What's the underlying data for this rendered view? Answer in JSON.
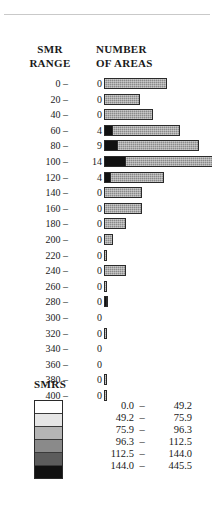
{
  "figure": {
    "header": {
      "left_line1": "SMR",
      "left_line2": "RANGE",
      "right_line1": "NUMBER",
      "right_line2": "OF AREAS"
    },
    "legend": {
      "title": "SMRS",
      "dash": "–",
      "entries": [
        {
          "low": "0.0",
          "high": "49.2",
          "color": "#ffffff"
        },
        {
          "low": "49.2",
          "high": "75.9",
          "color": "#e6e6e6"
        },
        {
          "low": "75.9",
          "high": "96.3",
          "color": "#b5b5b5"
        },
        {
          "low": "96.3",
          "high": "112.5",
          "color": "#8a8a8a"
        },
        {
          "low": "112.5",
          "high": "144.0",
          "color": "#5c5c5c"
        },
        {
          "low": "144.0",
          "high": "445.5",
          "color": "#111111"
        }
      ]
    }
  },
  "chart_data": {
    "type": "bar",
    "orientation": "horizontal",
    "title": "",
    "xlabel": "NUMBER OF AREAS",
    "ylabel": "SMR RANGE",
    "grid": false,
    "legend_position": "below",
    "dash": "–",
    "categories": [
      "0",
      "20",
      "40",
      "60",
      "80",
      "100",
      "120",
      "140",
      "160",
      "180",
      "200",
      "220",
      "240",
      "260",
      "280",
      "300",
      "320",
      "340",
      "360",
      "380",
      "400"
    ],
    "labels": [
      "0 –",
      "20 –",
      "40 –",
      "60 –",
      "80 –",
      "100 –",
      "120 –",
      "140 –",
      "160 –",
      "180 –",
      "200 –",
      "220 –",
      "240 –",
      "260 –",
      "280 –",
      "300 –",
      "320 –",
      "340 –",
      "360 –",
      "380 –",
      "400 –"
    ],
    "values": [
      0,
      0,
      0,
      4,
      9,
      14,
      4,
      0,
      0,
      0,
      0,
      0,
      0,
      0,
      0,
      0,
      0,
      0,
      0,
      0,
      0
    ],
    "bar_lengths_px": [
      63,
      36,
      49,
      76,
      95,
      111,
      60,
      38,
      38,
      22,
      9,
      3,
      22,
      3,
      4,
      0,
      3,
      0,
      0,
      3,
      3
    ],
    "dark_segment_px": [
      0,
      0,
      0,
      9,
      14,
      22,
      7,
      0,
      0,
      0,
      0,
      0,
      0,
      0,
      3,
      0,
      0,
      0,
      0,
      0,
      0
    ],
    "series": [
      {
        "name": "NUMBER OF AREAS",
        "values": [
          0,
          0,
          0,
          4,
          9,
          14,
          4,
          0,
          0,
          0,
          0,
          0,
          0,
          0,
          0,
          0,
          0,
          0,
          0,
          0,
          0
        ]
      }
    ]
  }
}
